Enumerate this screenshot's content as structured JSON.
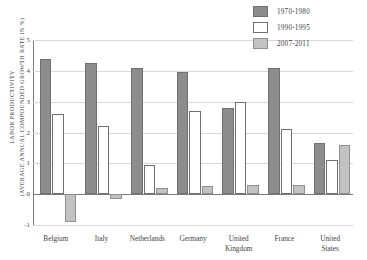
{
  "chart_data": {
    "type": "bar",
    "title": "",
    "xlabel": "",
    "ylabel": "LABOR PRODUCTIVITY\n(AVERAGE ANNUAL COMPOUNDED GROWTH RATE IN %)",
    "ylim": [
      -1,
      5
    ],
    "yticks": [
      -1,
      0,
      1,
      2,
      3,
      4,
      5
    ],
    "ytick_labels": [
      "-1",
      "0",
      "1",
      "2",
      "3",
      "4",
      "5"
    ],
    "grid": true,
    "legend_position": "top-right",
    "categories": [
      "Belgium",
      "Italy",
      "Netherlands",
      "Germany",
      "United Kingdom",
      "France",
      "United States"
    ],
    "series": [
      {
        "name": "1970-1980",
        "color": "#8d8d8d",
        "values": [
          4.4,
          4.25,
          4.1,
          3.95,
          2.8,
          4.1,
          1.65
        ]
      },
      {
        "name": "1990-1995",
        "color": "#ffffff",
        "values": [
          2.6,
          2.2,
          0.95,
          2.7,
          3.0,
          2.1,
          1.1
        ]
      },
      {
        "name": "2007-2011",
        "color": "#c2c2c2",
        "values": [
          -0.9,
          -0.15,
          0.2,
          0.25,
          0.3,
          0.3,
          1.6
        ]
      }
    ]
  }
}
